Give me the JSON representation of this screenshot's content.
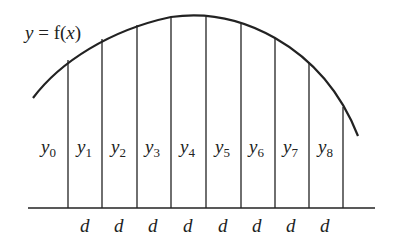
{
  "title": {
    "y": "y",
    "eq": " = f(",
    "x": "x",
    "close": ")"
  },
  "strips": [
    {
      "var": "y",
      "sub": "0"
    },
    {
      "var": "y",
      "sub": "1"
    },
    {
      "var": "y",
      "sub": "2"
    },
    {
      "var": "y",
      "sub": "3"
    },
    {
      "var": "y",
      "sub": "4"
    },
    {
      "var": "y",
      "sub": "5"
    },
    {
      "var": "y",
      "sub": "6"
    },
    {
      "var": "y",
      "sub": "7"
    },
    {
      "var": "y",
      "sub": "8"
    }
  ],
  "widths": [
    "d",
    "d",
    "d",
    "d",
    "d",
    "d",
    "d",
    "d"
  ],
  "colors": {
    "line": "#222222",
    "background": "#ffffff"
  }
}
